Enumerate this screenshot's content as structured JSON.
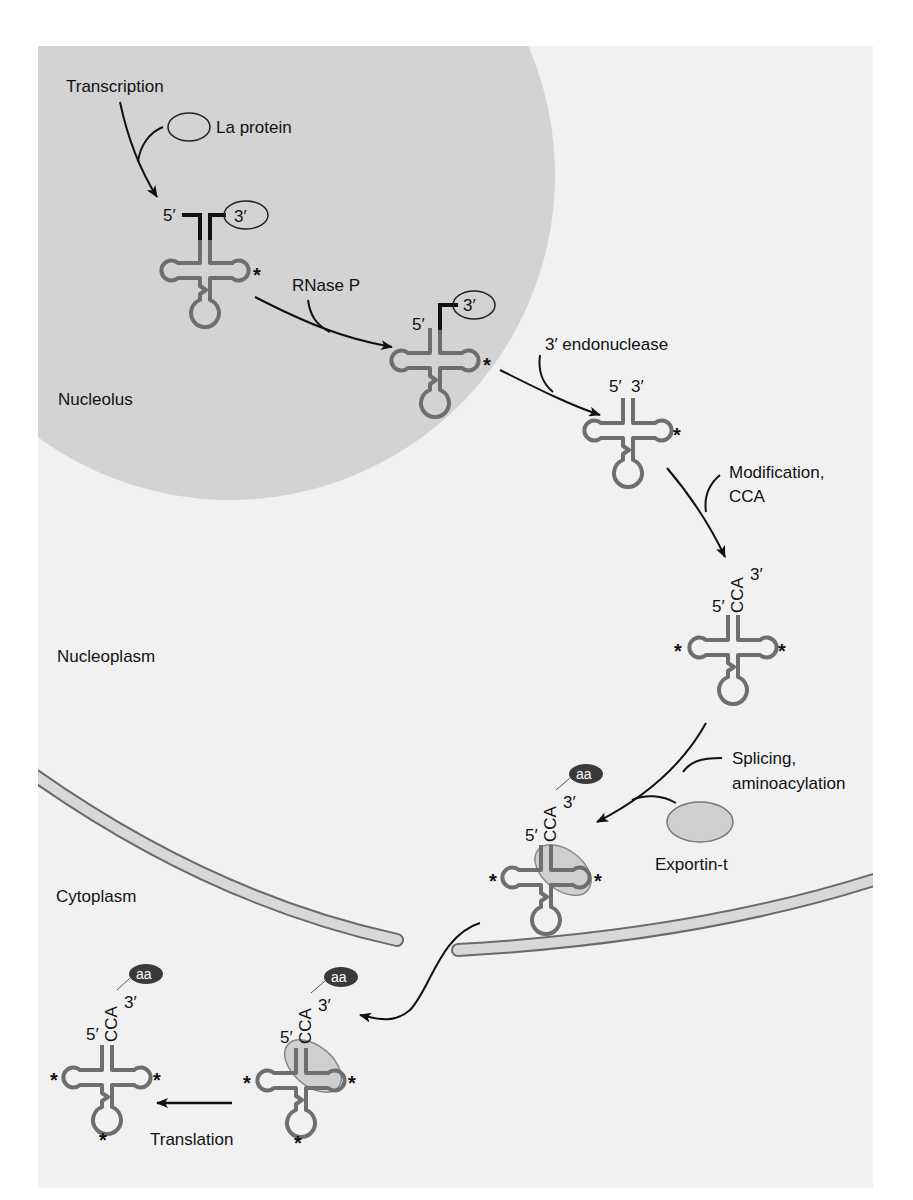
{
  "figure": {
    "compartments": {
      "nucleolus": "Nucleolus",
      "nucleoplasm": "Nucleoplasm",
      "cytoplasm": "Cytoplasm"
    },
    "steps": {
      "transcription": "Transcription",
      "la_protein": "La protein",
      "rnase_p": "RNase P",
      "endonuclease": "3′ endonuclease",
      "modification_line1": "Modification,",
      "modification_line2": "CCA",
      "splicing_line1": "Splicing,",
      "splicing_line2": "aminoacylation",
      "exportin": "Exportin-t",
      "translation": "Translation"
    },
    "labels": {
      "five_prime": "5′",
      "three_prime": "3′",
      "cca": "CCA",
      "aa": "aa",
      "modification_mark": "*"
    },
    "colors": {
      "background": "#f1f1f1",
      "nucleolus": "#d3d3d3",
      "trna_stroke": "#6e6e6e",
      "precursor_stroke": "#111111",
      "envelope_fill": "#d8d8d8",
      "envelope_stroke": "#6a6a6a",
      "exportin_fill": "#cfcfcf",
      "aa_fill": "#3a3a3a"
    }
  }
}
